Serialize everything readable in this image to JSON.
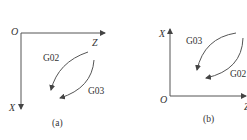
{
  "panels": [
    {
      "id": "a",
      "caption": "(a)",
      "origin_label": "O",
      "horizontal_axis_label": "Z",
      "vertical_axis_label": "X",
      "vertical_axis_direction": "down",
      "arc_labels": {
        "upper_left": "G02",
        "lower_right": "G03"
      }
    },
    {
      "id": "b",
      "caption": "(b)",
      "origin_label": "O",
      "horizontal_axis_label": "Z",
      "vertical_axis_label": "X",
      "vertical_axis_direction": "up",
      "arc_labels": {
        "upper_left": "G03",
        "lower_right": "G02"
      }
    }
  ],
  "colors": {
    "line": "#444444",
    "text": "#333333",
    "background": "#ffffff"
  }
}
